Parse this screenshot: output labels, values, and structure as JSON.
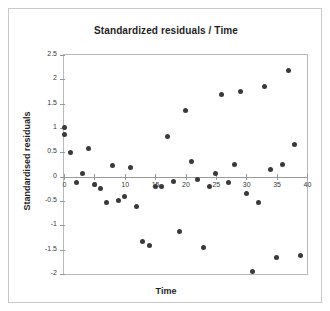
{
  "chart_data": {
    "type": "scatter",
    "title": "Standardized residuals / Time",
    "xlabel": "Time",
    "ylabel": "Standardised residuals",
    "xlim": [
      0,
      40
    ],
    "ylim": [
      -2,
      2.5
    ],
    "xticks": [
      0,
      5,
      10,
      15,
      20,
      25,
      30,
      35,
      40
    ],
    "xtick_labels": [
      "0",
      "5",
      "10",
      "15",
      "20",
      "25",
      "30",
      "35",
      "40"
    ],
    "yticks": [
      2.5,
      2,
      1.5,
      1,
      0.5,
      0,
      -0.5,
      -1,
      -1.5,
      -2
    ],
    "ytick_labels": [
      "2.5",
      "2",
      "1.5",
      "1",
      "0.5",
      "0",
      "-0.5",
      "-1",
      "-1.5",
      "-2"
    ],
    "grid": false,
    "legend": null,
    "marker": "circle",
    "marker_color": "#3a3a3a",
    "x": [
      0,
      0,
      1,
      2,
      3,
      4,
      5,
      6,
      7,
      8,
      9,
      10,
      11,
      12,
      13,
      14,
      15,
      16,
      17,
      18,
      19,
      20,
      21,
      22,
      23,
      24,
      25,
      26,
      27,
      28,
      29,
      30,
      31,
      32,
      33,
      34,
      35,
      36,
      37,
      38,
      39
    ],
    "y": [
      1.02,
      0.86,
      0.5,
      -0.12,
      0.07,
      0.57,
      -0.16,
      -0.24,
      -0.53,
      0.23,
      -0.49,
      -0.4,
      0.19,
      -0.62,
      -1.33,
      -1.42,
      -0.21,
      -0.2,
      0.83,
      -0.09,
      -1.12,
      1.35,
      0.32,
      -0.05,
      -1.46,
      -0.2,
      0.07,
      1.68,
      -0.12,
      0.24,
      1.76,
      -0.35,
      -1.95,
      -0.53,
      1.85,
      0.14,
      -1.67,
      0.26,
      2.18,
      0.67,
      -1.61
    ],
    "points": [
      {
        "x": 0,
        "y": 1.02
      },
      {
        "x": 0,
        "y": 0.86
      },
      {
        "x": 1,
        "y": 0.5
      },
      {
        "x": 2,
        "y": -0.12
      },
      {
        "x": 3,
        "y": 0.07
      },
      {
        "x": 4,
        "y": 0.57
      },
      {
        "x": 5,
        "y": -0.16
      },
      {
        "x": 6,
        "y": -0.24
      },
      {
        "x": 7,
        "y": -0.53
      },
      {
        "x": 8,
        "y": 0.23
      },
      {
        "x": 9,
        "y": -0.49
      },
      {
        "x": 10,
        "y": -0.4
      },
      {
        "x": 11,
        "y": 0.19
      },
      {
        "x": 12,
        "y": -0.62
      },
      {
        "x": 13,
        "y": -1.33
      },
      {
        "x": 14,
        "y": -1.42
      },
      {
        "x": 15,
        "y": -0.21
      },
      {
        "x": 16,
        "y": -0.2
      },
      {
        "x": 17,
        "y": 0.83
      },
      {
        "x": 18,
        "y": -0.09
      },
      {
        "x": 19,
        "y": -1.12
      },
      {
        "x": 20,
        "y": 1.35
      },
      {
        "x": 21,
        "y": 0.32
      },
      {
        "x": 22,
        "y": -0.05
      },
      {
        "x": 23,
        "y": -1.46
      },
      {
        "x": 24,
        "y": -0.2
      },
      {
        "x": 25,
        "y": 0.07
      },
      {
        "x": 26,
        "y": 1.68
      },
      {
        "x": 27,
        "y": -0.12
      },
      {
        "x": 28,
        "y": 0.24
      },
      {
        "x": 29,
        "y": 1.76
      },
      {
        "x": 30,
        "y": -0.35
      },
      {
        "x": 31,
        "y": -1.95
      },
      {
        "x": 32,
        "y": -0.53
      },
      {
        "x": 33,
        "y": 1.85
      },
      {
        "x": 34,
        "y": 0.14
      },
      {
        "x": 35,
        "y": -1.67
      },
      {
        "x": 36,
        "y": 0.26
      },
      {
        "x": 37,
        "y": 2.18
      },
      {
        "x": 38,
        "y": 0.67
      },
      {
        "x": 39,
        "y": -1.61
      }
    ]
  }
}
